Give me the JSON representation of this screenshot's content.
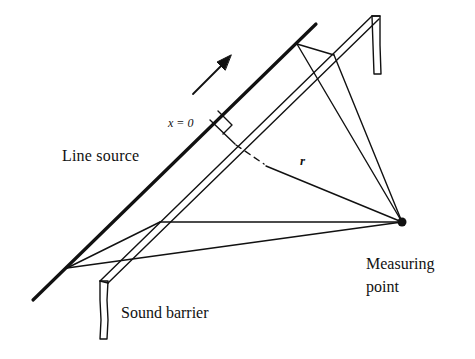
{
  "diagram": {
    "labels": {
      "line_source": "Line source",
      "x_origin": "x = 0",
      "distance": "r",
      "sound_barrier": "Sound barrier",
      "measuring_point_line1": "Measuring",
      "measuring_point_line2": "point"
    },
    "colors": {
      "ink": "#111111",
      "background": "#ffffff"
    },
    "elements": [
      "line-source (thick diagonal line)",
      "direction-arrow (source travel direction)",
      "sound-barrier (parallel double-line with end posts)",
      "perpendicular from x = 0 with right-angle marker",
      "distance r to measuring point (dashed behind barrier)",
      "diffraction rays from source points over barrier to measuring point",
      "measuring-point (filled dot)"
    ]
  }
}
